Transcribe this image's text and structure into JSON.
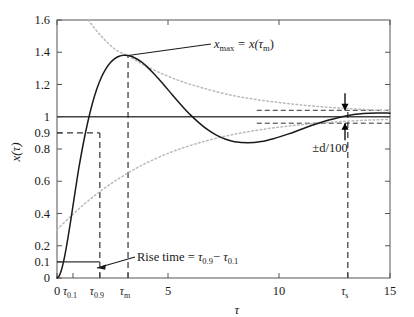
{
  "figure": {
    "background": "#ffffff",
    "line_color": "#1a1a1a",
    "envelope_color": "#b9b9b9",
    "dash_color": "#4a4a4a"
  },
  "axes": {
    "x_title": "τ",
    "y_title": "x(τ)",
    "xlim": [
      0,
      15
    ],
    "ylim": [
      0,
      1.6
    ],
    "x_ticks": [
      0,
      5,
      10,
      15
    ],
    "x_tick_labels": [
      "0",
      "5",
      "10",
      "15"
    ],
    "y_ticks": [
      0,
      0.1,
      0.2,
      0.4,
      0.6,
      0.8,
      0.9,
      1,
      1.2,
      1.4,
      1.6
    ],
    "y_tick_labels": [
      "0",
      "0.1",
      "0.2",
      "0.4",
      "0.6",
      "0.8",
      "0.9",
      "1",
      "1.2",
      "1.4",
      "1.6"
    ],
    "special_x_ticks": [
      {
        "value": 0.72,
        "label": "τ",
        "sub": "0.1"
      },
      {
        "value": 1.93,
        "label": "τ",
        "sub": "0.9"
      },
      {
        "value": 3.2,
        "label": "τ",
        "sub": "m"
      },
      {
        "value": 13.1,
        "label": "τ",
        "sub": "s"
      }
    ]
  },
  "annotations": {
    "xmax_label": "x",
    "xmax_sub": "max",
    "xmax_rest": " = x(τ",
    "xmax_rest_sub": "m",
    "xmax_rest_end": ")",
    "xmax_full": "x_max = x(τ_m)",
    "risetime_label": "Rise time = ",
    "risetime_tau1": "τ",
    "risetime_tau1_sub": "0.9",
    "risetime_minus": "− ",
    "risetime_tau2": "τ",
    "risetime_tau2_sub": "0.1",
    "risetime_full": "Rise time = τ_0.9 − τ_0.1",
    "band_label": "±d/100"
  },
  "chart_data": {
    "type": "line",
    "title": "",
    "xlabel": "τ",
    "ylabel": "x(τ)",
    "xlim": [
      0,
      15
    ],
    "ylim": [
      0,
      1.6
    ],
    "grid": false,
    "legend": null,
    "annotations": [
      {
        "text": "x_max = x(τ_m)",
        "x": 3.2,
        "y": 1.38,
        "type": "leader-line"
      },
      {
        "text": "Rise time = τ_0.9 − τ_0.1",
        "x": 1.3,
        "y": 0.1,
        "type": "leader-line"
      },
      {
        "text": "±d/100",
        "x": 11.0,
        "y": 0.78,
        "type": "double-arrow"
      }
    ],
    "markers": {
      "tau_0.1": 0.72,
      "tau_0.9": 1.93,
      "tau_m": 3.2,
      "tau_s": 13.1,
      "x_max": 1.38,
      "steady_state": 1.0,
      "band_upper": 1.04,
      "band_lower": 0.96
    },
    "series": [
      {
        "name": "step response x(τ)",
        "style": "solid",
        "color": "#1a1a1a",
        "x": [
          0,
          0.1,
          0.2,
          0.3,
          0.4,
          0.5,
          0.6,
          0.7,
          0.8,
          0.9,
          1.0,
          1.2,
          1.4,
          1.6,
          1.8,
          2.0,
          2.2,
          2.4,
          2.6,
          2.8,
          3.0,
          3.2,
          3.4,
          3.6,
          3.8,
          4.0,
          4.4,
          4.8,
          5.2,
          5.6,
          6.0,
          6.4,
          6.8,
          7.2,
          7.6,
          8.0,
          8.6,
          9.2,
          9.8,
          10.4,
          11.0,
          11.6,
          12.2,
          13.0,
          13.8,
          14.4,
          15.0
        ],
        "y": [
          0,
          0.013,
          0.05,
          0.105,
          0.175,
          0.255,
          0.34,
          0.43,
          0.52,
          0.61,
          0.695,
          0.845,
          0.975,
          1.085,
          1.175,
          1.245,
          1.297,
          1.335,
          1.36,
          1.375,
          1.381,
          1.38,
          1.372,
          1.358,
          1.34,
          1.317,
          1.262,
          1.2,
          1.135,
          1.072,
          1.013,
          0.962,
          0.918,
          0.884,
          0.86,
          0.845,
          0.838,
          0.846,
          0.866,
          0.892,
          0.922,
          0.952,
          0.978,
          1.005,
          1.02,
          1.024,
          1.022
        ]
      },
      {
        "name": "upper exponential envelope",
        "style": "dotted",
        "color": "#b9b9b9",
        "x": [
          1.4,
          1.8,
          2.2,
          2.6,
          3.0,
          3.2,
          3.6,
          4.0,
          4.6,
          5.2,
          5.8,
          6.4,
          7.0,
          7.8,
          8.6,
          9.4,
          10.2,
          11.0,
          11.8,
          12.6,
          13.4,
          14.2,
          15.0
        ],
        "y": [
          1.6,
          1.53,
          1.47,
          1.42,
          1.39,
          1.38,
          1.345,
          1.315,
          1.275,
          1.24,
          1.21,
          1.185,
          1.162,
          1.135,
          1.115,
          1.098,
          1.085,
          1.073,
          1.063,
          1.055,
          1.048,
          1.042,
          1.037
        ]
      },
      {
        "name": "lower exponential envelope",
        "style": "dotted",
        "color": "#b9b9b9",
        "x": [
          0.0,
          0.6,
          1.2,
          1.8,
          2.4,
          3.0,
          3.6,
          4.2,
          5.0,
          5.8,
          6.6,
          7.4,
          8.2,
          9.0,
          9.8,
          10.6,
          11.4,
          12.2,
          13.0,
          13.8,
          14.4,
          15.0
        ],
        "y": [
          0.3,
          0.38,
          0.455,
          0.522,
          0.582,
          0.635,
          0.683,
          0.725,
          0.773,
          0.813,
          0.846,
          0.874,
          0.897,
          0.916,
          0.932,
          0.945,
          0.956,
          0.965,
          0.972,
          0.978,
          0.981,
          0.984
        ]
      }
    ]
  }
}
